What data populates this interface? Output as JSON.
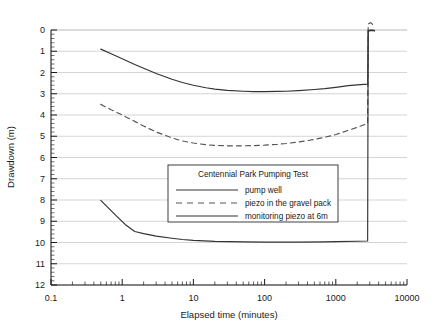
{
  "chart_data": {
    "type": "line",
    "title": "",
    "xlabel": "Elapsed time (minutes)",
    "ylabel": "Drawdown (m)",
    "xscale": "log",
    "yscale": "linear",
    "y_inverted": true,
    "xlim": [
      0.1,
      10000
    ],
    "ylim": [
      0,
      12
    ],
    "grid": true,
    "legend_position": "center",
    "legend_title": "Centennial Park Pumping Test",
    "x_ticks": [
      "0.1",
      "1",
      "10",
      "100",
      "1000",
      "10000"
    ],
    "x_tick_values": [
      0.1,
      1,
      10,
      100,
      1000,
      10000
    ],
    "y_ticks": [
      "0",
      "1",
      "2",
      "3",
      "4",
      "5",
      "6",
      "7",
      "8",
      "9",
      "10",
      "11",
      "12"
    ],
    "y_tick_values": [
      0,
      1,
      2,
      3,
      4,
      5,
      6,
      7,
      8,
      9,
      10,
      11,
      12
    ],
    "series": [
      {
        "name": "pump well",
        "style": "solid",
        "color": "#333333",
        "points": [
          [
            0.5,
            0.9
          ],
          [
            0.7,
            1.12
          ],
          [
            1.0,
            1.35
          ],
          [
            1.5,
            1.62
          ],
          [
            2.0,
            1.8
          ],
          [
            3.0,
            2.05
          ],
          [
            5.0,
            2.32
          ],
          [
            7.0,
            2.47
          ],
          [
            10.0,
            2.6
          ],
          [
            15.0,
            2.72
          ],
          [
            20.0,
            2.78
          ],
          [
            30.0,
            2.84
          ],
          [
            50.0,
            2.88
          ],
          [
            70.0,
            2.9
          ],
          [
            100.0,
            2.9
          ],
          [
            150.0,
            2.89
          ],
          [
            200.0,
            2.88
          ],
          [
            300.0,
            2.85
          ],
          [
            500.0,
            2.8
          ],
          [
            700.0,
            2.76
          ],
          [
            1000.0,
            2.7
          ],
          [
            1500.0,
            2.62
          ],
          [
            2000.0,
            2.58
          ],
          [
            2800.0,
            2.55
          ],
          [
            2850.0,
            0.05
          ],
          [
            3200.0,
            0.02
          ],
          [
            3500.0,
            0.05
          ]
        ]
      },
      {
        "name": "piezo in the gravel pack",
        "style": "dashed",
        "color": "#555555",
        "points": [
          [
            0.5,
            3.5
          ],
          [
            0.7,
            3.75
          ],
          [
            1.0,
            4.0
          ],
          [
            1.5,
            4.3
          ],
          [
            2.0,
            4.52
          ],
          [
            3.0,
            4.8
          ],
          [
            5.0,
            5.08
          ],
          [
            7.0,
            5.22
          ],
          [
            10.0,
            5.32
          ],
          [
            15.0,
            5.4
          ],
          [
            20.0,
            5.43
          ],
          [
            30.0,
            5.45
          ],
          [
            50.0,
            5.45
          ],
          [
            70.0,
            5.44
          ],
          [
            100.0,
            5.42
          ],
          [
            150.0,
            5.38
          ],
          [
            200.0,
            5.34
          ],
          [
            300.0,
            5.27
          ],
          [
            500.0,
            5.15
          ],
          [
            700.0,
            5.05
          ],
          [
            1000.0,
            4.92
          ],
          [
            1500.0,
            4.72
          ],
          [
            2000.0,
            4.58
          ],
          [
            2800.0,
            4.4
          ],
          [
            2850.0,
            -0.28
          ],
          [
            3100.0,
            -0.35
          ],
          [
            3400.0,
            -0.22
          ]
        ]
      },
      {
        "name": "monitoring piezo at 6m",
        "style": "solid",
        "color": "#333333",
        "points": [
          [
            0.5,
            8.02
          ],
          [
            0.8,
            8.7
          ],
          [
            1.1,
            9.15
          ],
          [
            1.5,
            9.48
          ],
          [
            2.0,
            9.58
          ],
          [
            3.0,
            9.7
          ],
          [
            5.0,
            9.8
          ],
          [
            7.0,
            9.86
          ],
          [
            10.0,
            9.9
          ],
          [
            20.0,
            9.95
          ],
          [
            50.0,
            9.97
          ],
          [
            100.0,
            9.98
          ],
          [
            300.0,
            9.98
          ],
          [
            700.0,
            9.97
          ],
          [
            1000.0,
            9.96
          ],
          [
            2000.0,
            9.94
          ],
          [
            2800.0,
            9.93
          ],
          [
            2850.0,
            0.02
          ],
          [
            3200.0,
            0.0
          ],
          [
            3500.0,
            0.02
          ]
        ]
      }
    ]
  },
  "legend": {
    "title": "Centennial Park Pumping Test",
    "entries": [
      {
        "label": "pump well",
        "style": "solid"
      },
      {
        "label": "piezo in the gravel pack",
        "style": "dashed"
      },
      {
        "label": "monitoring piezo at 6m",
        "style": "solid"
      }
    ]
  },
  "colors": {
    "axis": "#1a1a1a",
    "grid": "#b8b8b8",
    "curve": "#333333",
    "background": "#ffffff",
    "legend_border": "#2b2b2b"
  }
}
